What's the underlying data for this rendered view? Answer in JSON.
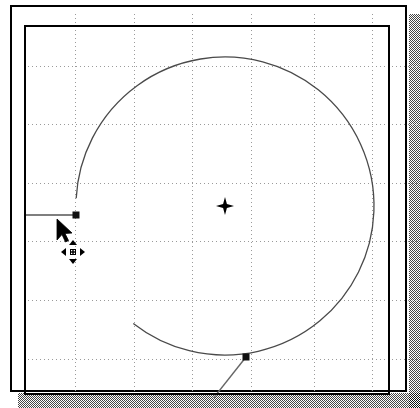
{
  "app": {
    "title": "CAD Drawing Canvas",
    "document_label": "Drawing Sheet",
    "window_label": "Drawing Window"
  },
  "canvas": {
    "background_color": "#ffffff",
    "frame_color": "#000000",
    "shadow_color": "#808080",
    "geometry_color": "#555555",
    "node_color": "#111111",
    "grid": {
      "visible": true,
      "style": "dotted",
      "color": "#9a9a9a",
      "spacing_px": 58.6,
      "x_lines": [
        51,
        110,
        168,
        227,
        290,
        348
      ],
      "y_lines": [
        52,
        110,
        169,
        227,
        286,
        345
      ]
    }
  },
  "geometry": {
    "circle": {
      "label": "Circle",
      "center_x": 201,
      "center_y": 192,
      "radius": 149,
      "start_angle_deg": 183,
      "sweep_deg": 305,
      "stroke": "#4a4a4a",
      "stroke_width": 1.3
    },
    "center_marker": {
      "label": "Center Point",
      "x": 201,
      "y": 192,
      "size": 18
    },
    "nodes": [
      {
        "label": "Quadrant Node Left",
        "x": 52,
        "y": 201
      },
      {
        "label": "Arc End Node",
        "x": 222,
        "y": 343
      }
    ],
    "lines": [
      {
        "label": "Leader Line Left",
        "x1": 0,
        "y1": 201,
        "x2": 52,
        "y2": 201,
        "stroke": "#555555",
        "stroke_width": 1.4
      },
      {
        "label": "Tangent Line Bottom",
        "x1": 222,
        "y1": 343,
        "x2": 184,
        "y2": 391,
        "stroke": "#666666",
        "stroke_width": 1.4
      }
    ]
  },
  "cursor": {
    "pointer_icon": "arrow-pointer-icon",
    "badge_icon": "move-four-arrows-icon",
    "pointer_x": 56,
    "pointer_y": 218,
    "badge_x": 60,
    "badge_y": 239,
    "mode_label": "Move"
  },
  "chart_data": {
    "type": "scatter",
    "xlabel": "",
    "ylabel": "",
    "grid": true,
    "legend": "none",
    "xlim": [
      0,
      394
    ],
    "ylim": [
      0,
      384
    ],
    "series": [
      {
        "name": "Circle",
        "kind": "arc",
        "center": [
          201,
          192
        ],
        "radius": 149,
        "start_angle_deg": 183,
        "sweep_deg": 305
      },
      {
        "name": "Control Points",
        "kind": "points",
        "x": [
          201,
          52,
          222
        ],
        "y": [
          192,
          201,
          343
        ],
        "labels": [
          "center",
          "left-quadrant",
          "arc-end"
        ]
      },
      {
        "name": "Leader Line Left",
        "kind": "line",
        "x": [
          0,
          52
        ],
        "y": [
          201,
          201
        ]
      },
      {
        "name": "Tangent Line Bottom",
        "kind": "line",
        "x": [
          222,
          184
        ],
        "y": [
          343,
          391
        ]
      }
    ]
  }
}
